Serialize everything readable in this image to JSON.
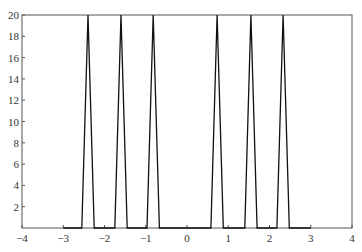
{
  "chart_data": {
    "type": "line",
    "title": "",
    "xlabel": "",
    "ylabel": "",
    "xlim": [
      -4,
      4
    ],
    "ylim": [
      0,
      20
    ],
    "grid": false,
    "legend": null,
    "x_ticks": [
      -4,
      -3,
      -2,
      -1,
      0,
      1,
      2,
      3,
      4
    ],
    "x_tick_labels": [
      "−4",
      "−3",
      "−2",
      "−1",
      "0",
      "1",
      "2",
      "3",
      "4"
    ],
    "y_ticks": [
      2,
      4,
      6,
      8,
      10,
      12,
      14,
      16,
      18,
      20
    ],
    "y_tick_labels": [
      "2",
      "4",
      "6",
      "8",
      "10",
      "12",
      "14",
      "16",
      "18",
      "20"
    ],
    "series": [
      {
        "name": "signal",
        "color": "#111111",
        "shape": "triangular peaks",
        "peaks": [
          {
            "center": -2.4,
            "height": 20,
            "base_half_width": 0.15
          },
          {
            "center": -1.6,
            "height": 20,
            "base_half_width": 0.15
          },
          {
            "center": -0.82,
            "height": 20,
            "base_half_width": 0.15
          },
          {
            "center": 0.73,
            "height": 20,
            "base_half_width": 0.15
          },
          {
            "center": 1.55,
            "height": 20,
            "base_half_width": 0.15
          },
          {
            "center": 2.33,
            "height": 20,
            "base_half_width": 0.15
          }
        ],
        "baseline": 0,
        "baseline_range": [
          -3.0,
          3.0
        ]
      }
    ]
  },
  "colors": {
    "axis": "#555555",
    "line": "#111111",
    "background": "#ffffff"
  }
}
